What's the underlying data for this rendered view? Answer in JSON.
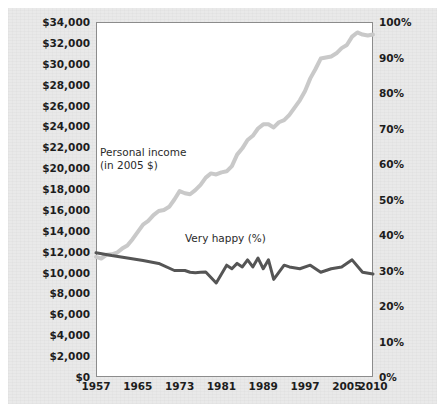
{
  "figure": {
    "background_color": "#e9e9e9",
    "plot_background_color": "#ffffff",
    "frame_color": "#8c8c8c"
  },
  "annotations": {
    "income_label_line1": "Personal income",
    "income_label_line2": "(in 2005 $)",
    "happy_label": "Very happy (%)"
  },
  "axes": {
    "left_ticks": [
      "$0",
      "$2,000",
      "$4,000",
      "$6,000",
      "$8,000",
      "$10,000",
      "$12,000",
      "$14,000",
      "$16,000",
      "$18,000",
      "$20,000",
      "$22,000",
      "$24,000",
      "$26,000",
      "$28,000",
      "$30,000",
      "$32,000",
      "$34,000"
    ],
    "right_ticks": [
      "0%",
      "10%",
      "20%",
      "30%",
      "40%",
      "50%",
      "60%",
      "70%",
      "80%",
      "90%",
      "100%"
    ],
    "x_ticks": [
      "1957",
      "1965",
      "1973",
      "1981",
      "1989",
      "1997",
      "2005",
      "2010"
    ]
  },
  "chart_data": {
    "type": "line",
    "title": "",
    "subtitle": "",
    "xlabel": "",
    "ylabel": "",
    "y2label": "",
    "xlim": [
      1957,
      2010
    ],
    "ylim": [
      0,
      34000
    ],
    "y2lim": [
      0,
      100
    ],
    "grid": false,
    "legend": "annotations-inline",
    "x_tick_values": [
      1957,
      1965,
      1973,
      1981,
      1989,
      1997,
      2005,
      2010
    ],
    "y_tick_values": [
      0,
      2000,
      4000,
      6000,
      8000,
      10000,
      12000,
      14000,
      16000,
      18000,
      20000,
      22000,
      24000,
      26000,
      28000,
      30000,
      32000,
      34000
    ],
    "y2_tick_values": [
      0,
      10,
      20,
      30,
      40,
      50,
      60,
      70,
      80,
      90,
      100
    ],
    "series": [
      {
        "name": "Personal income (in 2005 $)",
        "axis": "left",
        "color": "#c9c9c9",
        "line_width": 4,
        "x": [
          1957,
          1958,
          1959,
          1960,
          1961,
          1962,
          1963,
          1964,
          1965,
          1966,
          1967,
          1968,
          1969,
          1970,
          1971,
          1972,
          1973,
          1974,
          1975,
          1976,
          1977,
          1978,
          1979,
          1980,
          1981,
          1982,
          1983,
          1984,
          1985,
          1986,
          1987,
          1988,
          1989,
          1990,
          1991,
          1992,
          1993,
          1994,
          1995,
          1996,
          1997,
          1998,
          1999,
          2000,
          2001,
          2002,
          2003,
          2004,
          2005,
          2006,
          2007,
          2008,
          2009,
          2010
        ],
        "y": [
          11500,
          11350,
          11700,
          11750,
          11900,
          12300,
          12600,
          13200,
          13900,
          14600,
          14950,
          15500,
          15900,
          16000,
          16300,
          17000,
          17800,
          17600,
          17500,
          17900,
          18400,
          19100,
          19500,
          19400,
          19600,
          19700,
          20200,
          21300,
          21900,
          22700,
          23100,
          23800,
          24200,
          24200,
          23900,
          24400,
          24600,
          25100,
          25800,
          26500,
          27400,
          28600,
          29500,
          30500,
          30600,
          30700,
          31000,
          31500,
          31800,
          32600,
          33000,
          32800,
          32700,
          32800
        ]
      },
      {
        "name": "Very happy (%)",
        "axis": "right",
        "color": "#555555",
        "line_width": 3,
        "x": [
          1957,
          1960,
          1963,
          1966,
          1969,
          1972,
          1973,
          1974,
          1975,
          1976,
          1977,
          1978,
          1980,
          1982,
          1983,
          1984,
          1985,
          1986,
          1987,
          1988,
          1989,
          1990,
          1991,
          1993,
          1994,
          1996,
          1998,
          2000,
          2002,
          2004,
          2006,
          2008,
          2010
        ],
        "y": [
          35.0,
          34.2,
          33.5,
          32.8,
          32.0,
          30.0,
          30.0,
          30.0,
          29.5,
          29.4,
          29.5,
          29.6,
          26.5,
          31.5,
          30.5,
          32.0,
          31.0,
          33.0,
          31.0,
          33.5,
          30.5,
          33.0,
          27.5,
          31.5,
          31.0,
          30.5,
          31.5,
          29.5,
          30.5,
          31.0,
          33.0,
          29.5,
          29.0
        ]
      }
    ]
  }
}
